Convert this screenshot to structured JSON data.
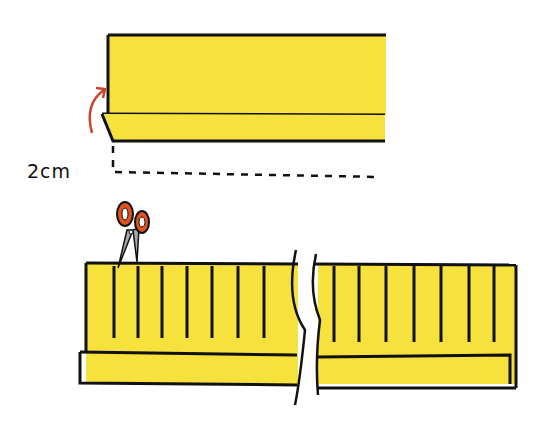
{
  "diagram": {
    "measurement_label": "2cm",
    "colors": {
      "fabric": "#f7e13c",
      "outline": "#111111",
      "arrow": "#c9452c",
      "scissor_handle": "#e0521e",
      "scissor_blade": "#a8a8a8"
    },
    "steps": [
      {
        "name": "fold-hem",
        "description": "Fold up 2cm hem strip"
      },
      {
        "name": "cut-fringe",
        "description": "Cut vertical slits along strip"
      }
    ]
  }
}
